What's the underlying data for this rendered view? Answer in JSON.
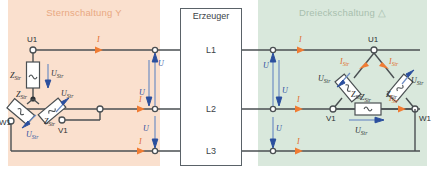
{
  "figure": {
    "background": "#ffffff"
  },
  "colors": {
    "star_panel_bg": "#fae0ce",
    "delta_panel_bg": "#d9e8dc",
    "star_title": "#e9a882",
    "delta_title": "#a8bfae",
    "wire": "#4a4f52",
    "voltage_arrow": "#2b4f9e",
    "current_arrow": "#f07c33",
    "generator_border": "#5a6268"
  },
  "star_panel": {
    "title": "Sternschaltung Y",
    "terminals": {
      "u1": "U1",
      "v1": "V1",
      "w1": "W1"
    },
    "impedance_label": "Z",
    "impedance_sub": "Str",
    "phase_voltage_label": "U",
    "phase_voltage_sub": "Str",
    "line_current_label": "I",
    "line_voltage_label": "U",
    "impedances": [
      {
        "name": "Z_Str top",
        "label": "Z",
        "sub": "Str"
      },
      {
        "name": "Z_Str left",
        "label": "Z",
        "sub": "Str"
      },
      {
        "name": "Z_Str right",
        "label": "Z",
        "sub": "Str"
      }
    ],
    "phase_voltages": [
      {
        "label": "U",
        "sub": "Str"
      },
      {
        "label": "U",
        "sub": "Str"
      },
      {
        "label": "U",
        "sub": "Str"
      }
    ],
    "line_currents": [
      {
        "label": "I"
      },
      {
        "label": "I"
      },
      {
        "label": "I"
      }
    ],
    "line_voltages": [
      {
        "label": "U"
      },
      {
        "label": "U"
      },
      {
        "label": "U"
      }
    ]
  },
  "generator": {
    "title": "Erzeuger",
    "lines": [
      {
        "label": "L1"
      },
      {
        "label": "L2"
      },
      {
        "label": "L3"
      }
    ]
  },
  "delta_panel": {
    "title": "Dreieckschaltung △",
    "terminals": {
      "u1": "U1",
      "v1": "V1",
      "w1": "W1"
    },
    "impedance_label": "Z",
    "impedance_sub": "Str",
    "phase_voltage_label": "U",
    "phase_voltage_sub": "Str",
    "phase_current_label": "I",
    "phase_current_sub": "Str",
    "line_current_label": "I",
    "line_voltage_label": "U",
    "impedances": [
      {
        "name": "Z_Str left-leg",
        "label": "Z",
        "sub": "Str"
      },
      {
        "name": "Z_Str right-leg",
        "label": "Z",
        "sub": "Str"
      },
      {
        "name": "Z_Str bottom",
        "label": "Z",
        "sub": "Str"
      }
    ],
    "phase_voltages": [
      {
        "label": "U",
        "sub": "Str"
      },
      {
        "label": "U",
        "sub": "Str"
      },
      {
        "label": "U",
        "sub": "Str"
      }
    ],
    "phase_currents": [
      {
        "label": "I",
        "sub": "Str"
      },
      {
        "label": "I",
        "sub": "Str"
      },
      {
        "label": "I",
        "sub": "Str"
      }
    ],
    "line_currents": [
      {
        "label": "I"
      },
      {
        "label": "I"
      },
      {
        "label": "I"
      }
    ],
    "line_voltages": [
      {
        "label": "U"
      },
      {
        "label": "U"
      },
      {
        "label": "U"
      }
    ]
  },
  "caption": {
    "star": "",
    "delta": ""
  }
}
